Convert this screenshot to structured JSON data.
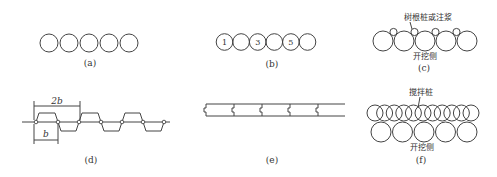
{
  "panels": {
    "a": {
      "label": "(a)",
      "circle_count": 5
    },
    "b": {
      "label": "(b)",
      "circle_count": 6,
      "numbers": [
        "1",
        "",
        "3",
        "",
        "5",
        ""
      ]
    },
    "c": {
      "label": "(c)",
      "annotation": "树根桩或注浆",
      "side_label": "开挖侧",
      "large_circle_count": 5,
      "small_circle_count": 4
    },
    "d": {
      "label": "(d)",
      "dim_2b": "2b",
      "dim_b": "b"
    },
    "e": {
      "label": "(e)",
      "sheet_count": 5
    },
    "f": {
      "label": "(f)",
      "annotation": "搅拌桩",
      "side_label": "开挖侧",
      "top_circle_count": 11,
      "bottom_circle_count": 5
    }
  }
}
